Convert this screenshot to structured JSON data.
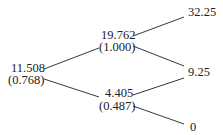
{
  "tree": {
    "type": "binomial-tree",
    "nodes": {
      "root": {
        "value": "11.508",
        "delta": "(0.768)"
      },
      "up": {
        "value": "19.762",
        "delta": "(1.000)"
      },
      "down": {
        "value": "4.405",
        "delta": "(0.487)"
      },
      "uu": {
        "value": "32.25"
      },
      "ud": {
        "value": "9.25"
      },
      "dd": {
        "value": "0"
      }
    },
    "edges": [
      [
        "root",
        "up"
      ],
      [
        "root",
        "down"
      ],
      [
        "up",
        "uu"
      ],
      [
        "up",
        "ud"
      ],
      [
        "down",
        "ud"
      ],
      [
        "down",
        "dd"
      ]
    ],
    "line_color": "#222222"
  }
}
